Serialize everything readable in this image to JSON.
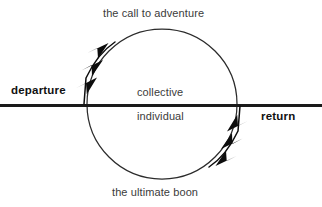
{
  "diagram": {
    "colors": {
      "line": "#1a1a1a",
      "circle": "#2b2b2b",
      "arrow": "#0d0d0d",
      "text_light": "#3b3b3b",
      "text_bold": "#111111",
      "background": "#ffffff"
    },
    "axis": {
      "left_label": "departure",
      "right_label": "return"
    },
    "circle_labels": {
      "top": "the call to adventure",
      "bottom": "the ultimate boon",
      "upper_middle": "collective",
      "lower_middle": "individual"
    },
    "arrows": [
      {
        "name": "descent-arrow",
        "direction": "down-left",
        "position": "upper-left of circle",
        "chevrons": 3
      },
      {
        "name": "ascent-arrow",
        "direction": "up-right",
        "position": "lower-right of circle",
        "chevrons": 3
      }
    ],
    "geometry": {
      "circle_center_x": 162,
      "circle_center_y": 104,
      "circle_radius": 75,
      "axis_y": 105
    }
  }
}
